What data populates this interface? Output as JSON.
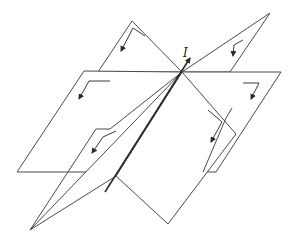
{
  "diagram": {
    "type": "intersecting-planes-field-lines",
    "current_label": "I",
    "colors": {
      "stroke": "#4a4a4a",
      "axis": "#2a2a2a",
      "background": "#ffffff"
    },
    "planes": [
      {
        "name": "back-left-plane",
        "arrow": "down-left"
      },
      {
        "name": "left-plane",
        "arrow": "down-left"
      },
      {
        "name": "front-left-plane",
        "arrow": "down-left"
      },
      {
        "name": "back-right-plane",
        "arrow": "down-left"
      },
      {
        "name": "right-plane",
        "arrow": "down-left"
      },
      {
        "name": "front-right-plane",
        "arrow": "down-left"
      }
    ]
  }
}
